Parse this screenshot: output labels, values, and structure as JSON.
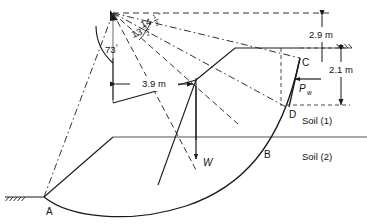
{
  "figure": {
    "type": "slope-stability-diagram",
    "title": "",
    "background_color": "#ffffff",
    "line_color": "#1a1a1a",
    "dashed_color": "#333333"
  },
  "points": {
    "A": {
      "label": "A",
      "x": 42,
      "y": 204
    },
    "B": {
      "label": "B",
      "x": 262,
      "y": 147
    },
    "C": {
      "label": "C",
      "x": 300,
      "y": 58
    },
    "D": {
      "label": "D",
      "x": 289,
      "y": 107
    }
  },
  "dimensions": {
    "top": {
      "label": "2.9 m",
      "value": 2.9,
      "unit": "m"
    },
    "right": {
      "label": "2.1 m",
      "value": 2.1,
      "unit": "m"
    },
    "horizontal": {
      "label": "3.9 m",
      "value": 3.9,
      "unit": "m"
    }
  },
  "angles": {
    "main": {
      "whole": "73",
      "degree": "°",
      "label": "73°",
      "value": 73
    },
    "upper": {
      "whole": "14",
      "numerator": "1",
      "denominator": "2",
      "degree": "°",
      "label": "14½°",
      "value": 14.5
    },
    "lower": {
      "whole": "13",
      "numerator": "1",
      "denominator": "2",
      "degree": "°",
      "label": "13½°",
      "value": 13.5
    }
  },
  "forces": {
    "weight": {
      "symbol": "W",
      "label": "W",
      "direction": "down"
    },
    "water_pressure": {
      "symbol": "P",
      "subscript": "w",
      "label": "Pw",
      "direction": "right"
    }
  },
  "soils": {
    "upper": {
      "label": "Soil (1)"
    },
    "lower": {
      "label": "Soil (2)"
    }
  },
  "ground_marks": {
    "left": "ground-hatch",
    "right": "ground-hatch"
  }
}
